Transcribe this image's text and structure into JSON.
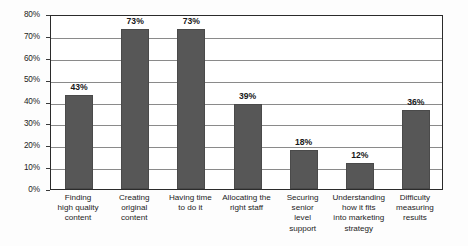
{
  "chart_data": {
    "type": "bar",
    "title": "",
    "xlabel": "",
    "ylabel": "",
    "ylim": [
      0,
      80
    ],
    "y_tick_step": 10,
    "grid": true,
    "legend": "none",
    "orientation": "vertical",
    "value_labels_shown": true,
    "bar_color": "#575757",
    "axis_color": "#2b2b2b",
    "gridline_color": "#8a8a8a",
    "categories": [
      "Finding high quality content",
      "Creating original content",
      "Having time to do it",
      "Allocating the right staff",
      "Securing senior level support",
      "Understanding how it fits into marketing strategy",
      "Difficulty measuring results"
    ],
    "category_lines": [
      [
        "Finding",
        "high quality",
        "content"
      ],
      [
        "Creating",
        "original",
        "content"
      ],
      [
        "Having time",
        "to do it"
      ],
      [
        "Allocating the",
        "right staff"
      ],
      [
        "Securing",
        "senior",
        "level",
        "support"
      ],
      [
        "Understanding",
        "how it fits",
        "into marketing",
        "strategy"
      ],
      [
        "Difficulty",
        "measuring",
        "results"
      ]
    ],
    "values": [
      43,
      73,
      73,
      39,
      18,
      12,
      36
    ],
    "value_labels": [
      "43%",
      "73%",
      "73%",
      "39%",
      "18%",
      "12%",
      "36%"
    ],
    "y_tick_labels": [
      "0%",
      "10%",
      "20%",
      "30%",
      "40%",
      "50%",
      "60%",
      "70%",
      "80%"
    ],
    "y_tick_values": [
      0,
      10,
      20,
      30,
      40,
      50,
      60,
      70,
      80
    ]
  }
}
